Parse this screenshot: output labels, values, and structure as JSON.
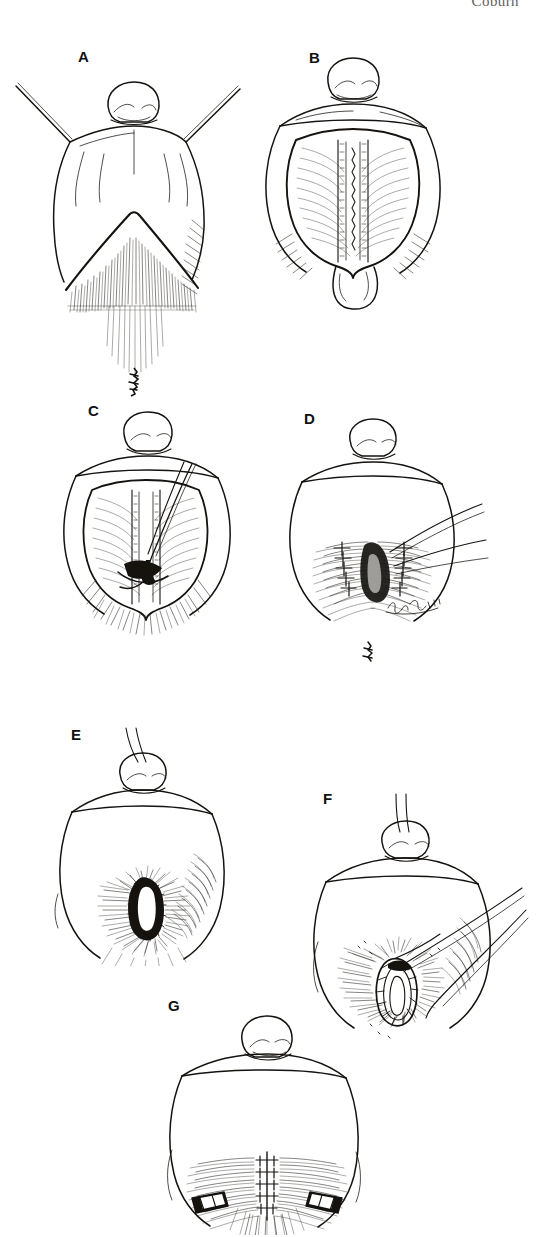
{
  "page": {
    "running_head": "Coburn",
    "width": 541,
    "height": 1237,
    "background_color": "#ffffff",
    "ink_color": "#15120f"
  },
  "figure": {
    "type": "surgical-technique-line-illustration",
    "medium": "pen-and-ink",
    "panel_count": 7,
    "artist_signature_present": true,
    "panels": [
      {
        "id": "A",
        "label": "A",
        "label_x": 85,
        "label_y": 58,
        "description": "Perineum retracted laterally by two traction sutures; inverted-V incision outlined over the hair-bearing midline."
      },
      {
        "id": "B",
        "label": "B",
        "label_x": 315,
        "label_y": 58,
        "description": "Flap elevated and reflected inferiorly exposing the midline raphe and underlying musculature."
      },
      {
        "id": "C",
        "label": "C",
        "label_x": 95,
        "label_y": 410,
        "description": "Curved needle with suture passed through the deep midline tissue of the exposed field."
      },
      {
        "id": "D",
        "label": "D",
        "label_x": 310,
        "label_y": 418,
        "description": "Interrupted sutures placed on either side of the midline; suture tails drawn laterally."
      },
      {
        "id": "E",
        "label": "E",
        "label_x": 78,
        "label_y": 735,
        "description": "Completed oval neo-aperture within the hair-bearing field, circumferentially sutured."
      },
      {
        "id": "F",
        "label": "F",
        "label_x": 330,
        "label_y": 800,
        "description": "Long suture strands carried obliquely across the field to the sutured aperture."
      },
      {
        "id": "G",
        "label": "G",
        "label_x": 175,
        "label_y": 1008,
        "description": "Final midline closure with interrupted sutures and a lateral drain placed on each side."
      }
    ]
  }
}
